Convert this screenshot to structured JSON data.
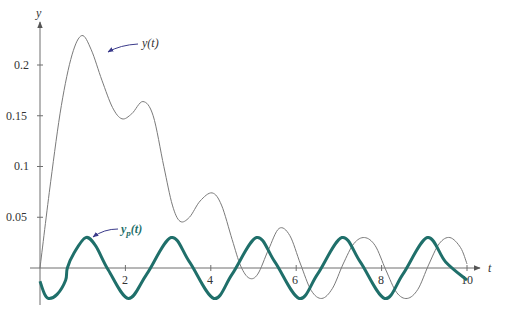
{
  "chart_data": {
    "type": "line",
    "title": "",
    "xlabel": "t",
    "ylabel": "y",
    "xlim": [
      0,
      10
    ],
    "ylim": [
      -0.035,
      0.24
    ],
    "grid": false,
    "legend": "none (curves labeled with inline annotations)",
    "x_ticks": [
      2,
      4,
      6,
      8,
      10
    ],
    "x_tick_labels": [
      "2",
      "4",
      "6",
      "8",
      "10"
    ],
    "y_ticks": [
      0.05,
      0.1,
      0.15,
      0.2
    ],
    "y_tick_labels": [
      "0.05",
      "0.1",
      "0.15",
      "0.2"
    ],
    "series": [
      {
        "name": "y(t)",
        "label": "y(t)",
        "color": "#7a7a7a",
        "width": 1,
        "x": [
          0,
          0.25,
          0.5,
          0.75,
          0.98,
          1.2,
          1.45,
          1.7,
          1.92,
          2.15,
          2.41,
          2.65,
          2.9,
          3.1,
          3.28,
          3.5,
          3.75,
          4.03,
          4.25,
          4.5,
          4.7,
          4.9,
          5.1,
          5.35,
          5.6,
          5.85,
          6.1,
          6.35,
          6.6,
          6.85,
          7.1,
          7.35,
          7.6,
          7.85,
          8.1,
          8.35,
          8.6,
          8.85,
          9.1,
          9.35,
          9.6,
          9.85,
          10
        ],
        "y": [
          0,
          0.085,
          0.16,
          0.21,
          0.229,
          0.215,
          0.185,
          0.158,
          0.147,
          0.152,
          0.164,
          0.15,
          0.1,
          0.062,
          0.046,
          0.05,
          0.066,
          0.074,
          0.062,
          0.028,
          0.002,
          -0.01,
          -0.006,
          0.018,
          0.039,
          0.032,
          0.004,
          -0.022,
          -0.03,
          -0.02,
          0.004,
          0.024,
          0.03,
          0.022,
          -0.002,
          -0.024,
          -0.03,
          -0.021,
          0.003,
          0.024,
          0.03,
          0.02,
          0.004
        ]
      },
      {
        "name": "y_p(t)",
        "label": "y_p(t)",
        "color": "#1f6f6a",
        "width": 3,
        "formula_approx": "0.03*cos(pi*(t-1.07))",
        "x": [
          0,
          0.1,
          0.2,
          0.4,
          0.6,
          0.64,
          0.8,
          1.07,
          1.3,
          1.6,
          2.07,
          2.5,
          3.07,
          3.5,
          4.07,
          4.5,
          5.07,
          5.5,
          6.07,
          6.5,
          7.07,
          7.5,
          8.07,
          8.5,
          9.07,
          9.5,
          10
        ],
        "y": [
          -0.013,
          -0.025,
          -0.03,
          -0.026,
          -0.012,
          0.0,
          0.015,
          0.03,
          0.022,
          -0.002,
          -0.03,
          -0.006,
          0.03,
          0.006,
          -0.03,
          -0.006,
          0.03,
          0.006,
          -0.03,
          -0.006,
          0.03,
          0.006,
          -0.03,
          -0.006,
          0.03,
          0.006,
          -0.012
        ]
      }
    ],
    "annotations": [
      {
        "text": "y(t)",
        "series": "y(t)",
        "arrow_to": [
          1.55,
          0.2
        ]
      },
      {
        "text": "y_p(t)",
        "series": "y_p(t)",
        "arrow_to": [
          1.15,
          0.03
        ]
      }
    ]
  },
  "labels": {
    "x_axis": "t",
    "y_axis": "y",
    "anno_y": "y(t)",
    "anno_yp_main": "y",
    "anno_yp_sub": "p",
    "anno_yp_tail": "(t)",
    "xt2": "2",
    "xt4": "4",
    "xt6": "6",
    "xt8": "8",
    "xt10": "10",
    "yt005": "0.05",
    "yt01": "0.1",
    "yt015": "0.15",
    "yt02": "0.2"
  },
  "colors": {
    "axis": "#6e6e6e",
    "y_curve": "#7a7a7a",
    "yp_curve": "#1f6f6a",
    "arrow": "#3a3a8a"
  }
}
